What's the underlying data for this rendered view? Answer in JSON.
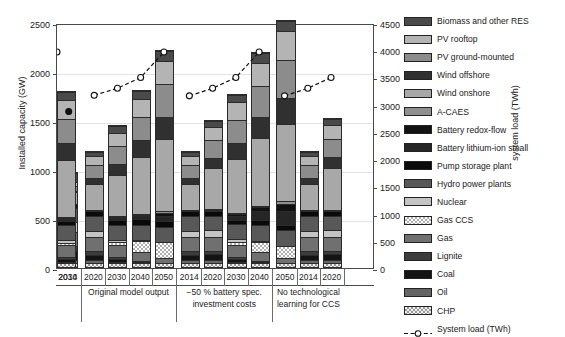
{
  "chart_data": {
    "type": "bar",
    "subtype": "stacked-bar-with-line-overlay",
    "title": "",
    "xlabel": "",
    "ylabel": "Installed capacity (GW)",
    "y2label": "system load (TWh)",
    "ylim": [
      0,
      2500
    ],
    "y2lim": [
      0,
      4500
    ],
    "yticks": [
      0,
      500,
      1000,
      1500,
      2000,
      2500
    ],
    "y2ticks": [
      0,
      500,
      1000,
      1500,
      2000,
      2500,
      3000,
      3500,
      4000,
      4500
    ],
    "grid": true,
    "legend_position": "right",
    "categories": [
      "2014",
      "2020",
      "2030",
      "2040",
      "2050",
      "2014",
      "2020",
      "2030",
      "2040",
      "2050",
      "2014",
      "2020",
      "2030"
    ],
    "groups": [
      {
        "label": "",
        "span": 1
      },
      {
        "label": "Original model output",
        "span": 4
      },
      {
        "label": "−50 % battery spec. investment costs",
        "span": 4
      },
      {
        "label": "No technological learning for CCS",
        "span": 3
      }
    ],
    "series": [
      {
        "name": "CHP",
        "values": [
          40,
          45,
          45,
          45,
          45,
          45,
          45,
          45,
          45,
          45,
          45,
          45,
          45
        ]
      },
      {
        "name": "Oil",
        "values": [
          35,
          25,
          10,
          0,
          0,
          25,
          25,
          10,
          0,
          0,
          25,
          25,
          10
        ]
      },
      {
        "name": "Coal",
        "values": [
          90,
          60,
          25,
          5,
          0,
          60,
          60,
          25,
          5,
          0,
          60,
          60,
          25
        ]
      },
      {
        "name": "Lignite",
        "values": [
          55,
          40,
          20,
          5,
          0,
          40,
          40,
          20,
          5,
          0,
          40,
          40,
          20
        ]
      },
      {
        "name": "Gas",
        "values": [
          150,
          140,
          130,
          95,
          45,
          140,
          140,
          130,
          90,
          45,
          140,
          140,
          130
        ]
      },
      {
        "name": "Gas CCS",
        "values": [
          0,
          0,
          25,
          110,
          165,
          0,
          0,
          25,
          105,
          130,
          0,
          0,
          15
        ]
      },
      {
        "name": "Nuclear",
        "values": [
          100,
          70,
          30,
          5,
          0,
          70,
          70,
          30,
          5,
          0,
          70,
          70,
          30
        ]
      },
      {
        "name": "Hydro power plants",
        "values": [
          145,
          150,
          155,
          160,
          160,
          150,
          150,
          155,
          160,
          160,
          150,
          150,
          155
        ]
      },
      {
        "name": "Pump storage plant",
        "values": [
          45,
          50,
          50,
          55,
          55,
          50,
          50,
          50,
          55,
          55,
          50,
          50,
          50
        ]
      },
      {
        "name": "Battery lithium-ion small",
        "values": [
          0,
          5,
          15,
          35,
          55,
          5,
          15,
          40,
          90,
          140,
          5,
          10,
          20
        ]
      },
      {
        "name": "Battery redox-flow",
        "values": [
          0,
          0,
          5,
          15,
          30,
          0,
          5,
          15,
          45,
          75,
          0,
          0,
          10
        ]
      },
      {
        "name": "A-CAES",
        "values": [
          0,
          0,
          5,
          10,
          20,
          0,
          0,
          5,
          15,
          25,
          0,
          0,
          5
        ]
      },
      {
        "name": "Wind onshore",
        "values": [
          125,
          280,
          430,
          590,
          740,
          280,
          420,
          560,
          700,
          800,
          280,
          430,
          590
        ]
      },
      {
        "name": "Wind offshore",
        "values": [
          10,
          60,
          115,
          175,
          235,
          60,
          110,
          165,
          225,
          265,
          60,
          115,
          175
        ]
      },
      {
        "name": "PV ground-mounted",
        "values": [
          50,
          130,
          190,
          245,
          330,
          130,
          185,
          240,
          320,
          385,
          130,
          190,
          250
        ]
      },
      {
        "name": "PV rooftop",
        "values": [
          45,
          95,
          140,
          185,
          245,
          95,
          135,
          185,
          235,
          300,
          95,
          140,
          190
        ]
      },
      {
        "name": "Biomass and other RES",
        "values": [
          90,
          45,
          65,
          80,
          100,
          45,
          65,
          80,
          100,
          110,
          45,
          65,
          85
        ]
      }
    ],
    "overlay": {
      "name": "System load (TWh)",
      "unit": "TWh",
      "marker": "open-circle",
      "linestyle": "dashed",
      "points": [
        {
          "category": "2014",
          "value": 2900,
          "filled": true
        },
        {
          "category": "2020",
          "value": 3200,
          "filled": false
        },
        {
          "category": "2030",
          "value": 3330,
          "filled": false
        },
        {
          "category": "2040",
          "value": 3530,
          "filled": false
        },
        {
          "category": "2050",
          "value": 4000,
          "filled": false
        },
        {
          "category": "2014",
          "value": 3190,
          "filled": false
        },
        {
          "category": "2020",
          "value": 3330,
          "filled": false
        },
        {
          "category": "2030",
          "value": 3530,
          "filled": false
        },
        {
          "category": "2040",
          "value": 4000,
          "filled": false
        },
        {
          "category": "2014",
          "value": 3190,
          "filled": false
        },
        {
          "category": "2020",
          "value": 3330,
          "filled": false
        },
        {
          "category": "2030",
          "value": 3530,
          "filled": false
        },
        {
          "category": "2040",
          "value": 4000,
          "filled": false
        }
      ]
    }
  },
  "legend": {
    "items": [
      {
        "label": "Biomass and other RES",
        "swatch": "dark-gray",
        "color": "#4a4a4a",
        "pattern": "solid"
      },
      {
        "label": "PV rooftop",
        "swatch": "light-gray",
        "color": "#b4b4b4",
        "pattern": "solid"
      },
      {
        "label": "PV ground-mounted",
        "swatch": "medium-gray",
        "color": "#8c8c8c",
        "pattern": "solid"
      },
      {
        "label": "Wind offshore",
        "swatch": "near-black",
        "color": "#303030",
        "pattern": "solid"
      },
      {
        "label": "Wind onshore",
        "swatch": "light-gray-2",
        "color": "#a8a8a8",
        "pattern": "solid"
      },
      {
        "label": "A-CAES",
        "swatch": "gray",
        "color": "#909090",
        "pattern": "solid"
      },
      {
        "label": "Battery redox-flow",
        "swatch": "black",
        "color": "#121212",
        "pattern": "solid"
      },
      {
        "label": "Battery lithium-ion small",
        "swatch": "very-dark",
        "color": "#262626",
        "pattern": "solid"
      },
      {
        "label": "Pump storage plant",
        "swatch": "black-2",
        "color": "#0a0a0a",
        "pattern": "solid"
      },
      {
        "label": "Hydro power plants",
        "swatch": "dark-gray-2",
        "color": "#585858",
        "pattern": "solid"
      },
      {
        "label": "Nuclear",
        "swatch": "pale-gray",
        "color": "#c4c4c4",
        "pattern": "solid"
      },
      {
        "label": "Gas CCS",
        "swatch": "checker",
        "color": "#b0b0b0",
        "pattern": "checker"
      },
      {
        "label": "Gas",
        "swatch": "mid-gray",
        "color": "#707070",
        "pattern": "solid"
      },
      {
        "label": "Lignite",
        "swatch": "dark-gray-3",
        "color": "#3c3c3c",
        "pattern": "solid"
      },
      {
        "label": "Coal",
        "swatch": "black-3",
        "color": "#141414",
        "pattern": "solid"
      },
      {
        "label": "Oil",
        "swatch": "mid-gray-2",
        "color": "#656565",
        "pattern": "solid"
      },
      {
        "label": "CHP",
        "swatch": "dotted",
        "color": "#9a9a9a",
        "pattern": "dots"
      },
      {
        "label": "System load (TWh)",
        "swatch": "dashed-line",
        "color": "#111111",
        "pattern": "line"
      }
    ]
  }
}
